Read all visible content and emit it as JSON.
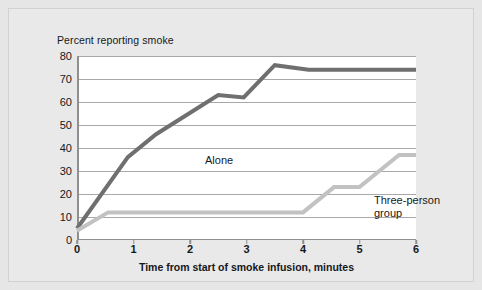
{
  "figure": {
    "background_color": "#e9e9e9",
    "plot_background_color": "#ffffff",
    "border_color": "#d2d2d2"
  },
  "chart_data": {
    "type": "line",
    "title": "Percent reporting smoke",
    "xlabel": "Time from start of smoke infusion, minutes",
    "ylabel": "",
    "xlim": [
      0,
      6
    ],
    "ylim": [
      0,
      80
    ],
    "xticks": [
      0,
      1,
      2,
      3,
      4,
      5,
      6
    ],
    "yticks": [
      0,
      10,
      20,
      30,
      40,
      50,
      60,
      70,
      80
    ],
    "xtick_labels": [
      "0",
      "1",
      "2",
      "3",
      "4",
      "5",
      "6"
    ],
    "ytick_labels": [
      "0",
      "10",
      "20",
      "30",
      "40",
      "50",
      "60",
      "70",
      "80"
    ],
    "grid": true,
    "grid_axis": "y",
    "grid_color": "#a8a8a8",
    "legend": "inline-annotations",
    "series": [
      {
        "name": "Alone",
        "color": "#6f6f6f",
        "linewidth": 4,
        "label_position": "inline",
        "points": [
          {
            "x": 0.0,
            "y": 5
          },
          {
            "x": 0.9,
            "y": 36
          },
          {
            "x": 1.4,
            "y": 46
          },
          {
            "x": 2.5,
            "y": 63
          },
          {
            "x": 2.95,
            "y": 62
          },
          {
            "x": 3.5,
            "y": 76
          },
          {
            "x": 4.1,
            "y": 74
          },
          {
            "x": 6.0,
            "y": 74
          }
        ]
      },
      {
        "name": "Three-person group",
        "color": "#c2c2c2",
        "linewidth": 4,
        "label_position": "inline",
        "points": [
          {
            "x": 0.0,
            "y": 4
          },
          {
            "x": 0.55,
            "y": 12
          },
          {
            "x": 4.0,
            "y": 12
          },
          {
            "x": 4.55,
            "y": 23
          },
          {
            "x": 5.0,
            "y": 23
          },
          {
            "x": 5.7,
            "y": 37
          },
          {
            "x": 6.0,
            "y": 37
          }
        ]
      }
    ],
    "annotations": [
      {
        "text": "Alone",
        "x": 1.05,
        "y": 55
      },
      {
        "text_line1": "Three-person",
        "text_line2": "group",
        "x": 4.05,
        "y": 43
      }
    ]
  },
  "labels": {
    "alone": "Alone",
    "group_line1": "Three-person",
    "group_line2": "group"
  }
}
